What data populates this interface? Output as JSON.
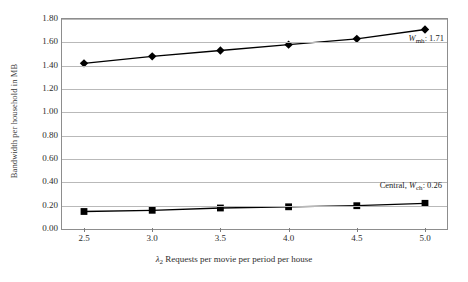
{
  "chart_data": {
    "type": "line",
    "title": "",
    "xlabel": "λ2 Requests per movie per period per house",
    "ylabel": "Bandwidth per household in MB",
    "x": [
      2.5,
      3.0,
      3.5,
      4.0,
      4.5,
      5.0
    ],
    "xticklabels": [
      "2.5",
      "3.0",
      "3.5",
      "4.0",
      "4.5",
      "5.0"
    ],
    "yticklabels": [
      "0.00",
      "0.20",
      "0.40",
      "0.60",
      "0.80",
      "1.00",
      "1.20",
      "1.40",
      "1.60",
      "1.80"
    ],
    "yticks": [
      0.0,
      0.2,
      0.4,
      0.6,
      0.8,
      1.0,
      1.2,
      1.4,
      1.6,
      1.8
    ],
    "xlim": [
      2.5,
      5.0
    ],
    "ylim": [
      0.0,
      1.8
    ],
    "grid": true,
    "legend_position": "none",
    "series": [
      {
        "name": "W_mh",
        "marker": "diamond",
        "color": "#000000",
        "values": [
          1.42,
          1.48,
          1.53,
          1.58,
          1.63,
          1.71
        ]
      },
      {
        "name": "Central, W_ch",
        "marker": "square",
        "color": "#000000",
        "values": [
          0.15,
          0.16,
          0.18,
          0.19,
          0.2,
          0.22
        ]
      }
    ],
    "annotations": [
      {
        "id": "wmh-label",
        "symbol": "W",
        "subscript": "mh",
        "separator": ": ",
        "value": "1.71",
        "full_text": "Wmh: 1.71"
      },
      {
        "id": "wch-label",
        "prefix": "Central, ",
        "symbol": "W",
        "subscript": "ch",
        "separator": ": ",
        "value": "0.26",
        "full_text": "Central, Wch: 0.26"
      }
    ]
  },
  "axis": {
    "x_title_symbol": "λ",
    "x_title_subscript": "2",
    "x_title_rest": " Requests per movie per period per house",
    "y_title": "Bandwidth per household in MB"
  },
  "colors": {
    "background": "#ffffff",
    "frame": "#8d8d8d",
    "gridline": "#b9b9b9",
    "series": "#000000",
    "text": "#2d2d2d"
  }
}
